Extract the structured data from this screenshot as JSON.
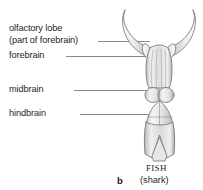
{
  "figure": {
    "panel_letter": "b",
    "specimen_title": "FISH",
    "specimen_subtitle": "(shark)",
    "background_color": "#ffffff",
    "text_color": "#231f20",
    "leader_line_color": "#8a8a8a"
  },
  "labels": {
    "olfactory_line1": "olfactory lobe",
    "olfactory_line2": "(part of forebrain)",
    "forebrain": "forebrain",
    "midbrain": "midbrain",
    "hindbrain": "hindbrain"
  },
  "illustration": {
    "name": "shark-brain-dorsal-view",
    "fill_light": "#f2f2f2",
    "fill_mid": "#dcdcdc",
    "fill_dark": "#bdbdbd",
    "outline": "#6e6e6e",
    "parts": [
      "olfactory-bulb-left",
      "olfactory-bulb-right",
      "olfactory-tract-left",
      "olfactory-tract-right",
      "forebrain-cerebrum",
      "midbrain-optic-lobe-left",
      "midbrain-optic-lobe-right",
      "hindbrain-cerebellum",
      "medulla-oblongata",
      "spinal-cord"
    ]
  }
}
